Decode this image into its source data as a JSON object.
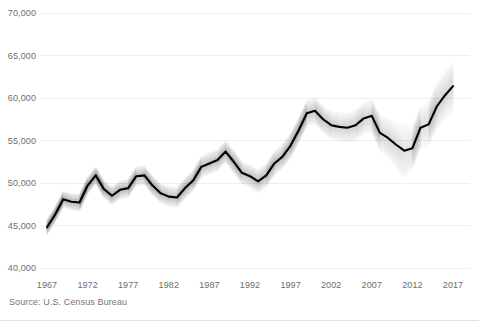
{
  "chart_data": {
    "type": "line",
    "title": "",
    "subtitle": "",
    "xlabel": "",
    "ylabel": "",
    "source": "Source: U.S. Census Bureau",
    "grid": true,
    "legend": "none",
    "xlim": [
      1967,
      2017
    ],
    "ylim": [
      40000,
      70000
    ],
    "y_tick_labels": [
      "70,000",
      "65,000",
      "60,000",
      "55,000",
      "50,000",
      "45,000",
      "40,000"
    ],
    "y_ticks": [
      70000,
      65000,
      60000,
      55000,
      50000,
      45000,
      40000
    ],
    "x_tick_labels": [
      "1967",
      "1972",
      "1977",
      "1982",
      "1987",
      "1992",
      "1997",
      "2002",
      "2007",
      "2012",
      "2017"
    ],
    "x_ticks": [
      1967,
      1972,
      1977,
      1982,
      1987,
      1992,
      1997,
      2002,
      2007,
      2012,
      2017
    ],
    "uncertainty": {
      "style": "layered-translucent-fan",
      "description": "margin of error band drawn as stacked semi-transparent strokes around the estimate",
      "band_half_width_values": [
        900,
        900,
        950,
        950,
        1000,
        1000,
        1000,
        1000,
        1050,
        1050,
        1050,
        1100,
        1100,
        1100,
        1150,
        1150,
        1150,
        1200,
        1200,
        1200,
        1250,
        1250,
        1250,
        1300,
        1300,
        1300,
        1350,
        1350,
        1400,
        1400,
        1450,
        1450,
        1500,
        1500,
        1550,
        1600,
        1650,
        1700,
        1750,
        1800,
        1900,
        2000,
        2300,
        2600,
        3200,
        2400,
        2400,
        2500,
        2600,
        2700,
        2800
      ]
    },
    "series": [
      {
        "name": "Median household income",
        "color": "#000000",
        "x": [
          1967,
          1968,
          1969,
          1970,
          1971,
          1972,
          1973,
          1974,
          1975,
          1976,
          1977,
          1978,
          1979,
          1980,
          1981,
          1982,
          1983,
          1984,
          1985,
          1986,
          1987,
          1988,
          1989,
          1990,
          1991,
          1992,
          1993,
          1994,
          1995,
          1996,
          1997,
          1998,
          1999,
          2000,
          2001,
          2002,
          2003,
          2004,
          2005,
          2006,
          2007,
          2008,
          2009,
          2010,
          2011,
          2012,
          2013,
          2014,
          2015,
          2016,
          2017
        ],
        "values": [
          44800,
          46300,
          48100,
          47800,
          47700,
          49700,
          50900,
          49300,
          48500,
          49200,
          49400,
          50800,
          50900,
          49700,
          48800,
          48400,
          48300,
          49400,
          50300,
          51900,
          52300,
          52700,
          53700,
          52500,
          51200,
          50800,
          50200,
          50900,
          52300,
          53100,
          54400,
          56200,
          58200,
          58500,
          57500,
          56800,
          56600,
          56500,
          56800,
          57600,
          57900,
          55900,
          55300,
          54500,
          53800,
          54100,
          56500,
          56900,
          59000,
          60300,
          61400
        ]
      }
    ]
  },
  "axis": {
    "y_label_color": "#6e6e6e",
    "x_label_color": "#6e6e6e",
    "gridline_color": "#efefef"
  },
  "footer": {
    "source_text": "Source: U.S. Census Bureau"
  }
}
